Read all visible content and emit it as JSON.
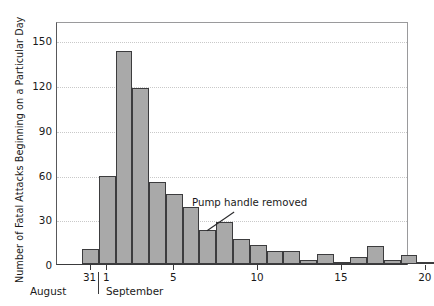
{
  "chart_data": {
    "type": "bar",
    "title": "",
    "subtitle": "",
    "xlabel": "",
    "ylabel": "Number of Fatal Attacks Beginning on a Particular Day",
    "ylim": [
      0,
      163
    ],
    "xlim": [
      29.0,
      50.0
    ],
    "grid": true,
    "legend": null,
    "bar_color": "#a9a9a9",
    "bar_edge_color": "#3c3c3e",
    "yticks": [
      0,
      30,
      60,
      90,
      120,
      150
    ],
    "ytick_labels": [
      "0",
      "30",
      "60",
      "90",
      "120",
      "150"
    ],
    "xticks": [
      31,
      32,
      36,
      41,
      46,
      51
    ],
    "xtick_labels": [
      "31",
      "1",
      "5",
      "10",
      "15",
      "20"
    ],
    "month_labels": [
      "August",
      "September"
    ],
    "categories": [
      "Aug 31",
      "Sep 1",
      "Sep 2",
      "Sep 3",
      "Sep 4",
      "Sep 5",
      "Sep 6",
      "Sep 7",
      "Sep 8",
      "Sep 9",
      "Sep 10",
      "Sep 11",
      "Sep 12",
      "Sep 13",
      "Sep 14",
      "Sep 15",
      "Sep 16",
      "Sep 17",
      "Sep 18",
      "Sep 19",
      "Sep 20"
    ],
    "values": [
      10,
      59,
      143,
      118,
      55,
      47,
      38,
      23,
      28,
      17,
      13,
      9,
      9,
      3,
      7,
      1,
      5,
      12,
      3,
      6,
      1
    ],
    "annotations": [
      {
        "text": "Pump handle removed",
        "points_to_category": "Sep 7"
      }
    ]
  }
}
